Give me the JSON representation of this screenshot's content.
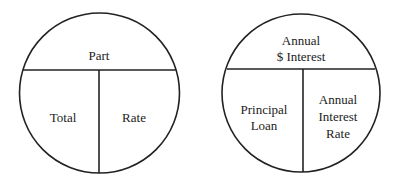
{
  "diagrams": [
    {
      "name": "general-percent-circle",
      "top": [
        "Part"
      ],
      "bottom_left": [
        "Total"
      ],
      "bottom_right": [
        "Rate"
      ]
    },
    {
      "name": "interest-percent-circle",
      "top": [
        "Annual",
        "$ Interest"
      ],
      "bottom_left": [
        "Principal",
        "Loan"
      ],
      "bottom_right": [
        "Annual",
        "Interest",
        "Rate"
      ]
    }
  ],
  "colors": {
    "stroke": "#222222",
    "text": "#222222",
    "background": "#ffffff"
  }
}
